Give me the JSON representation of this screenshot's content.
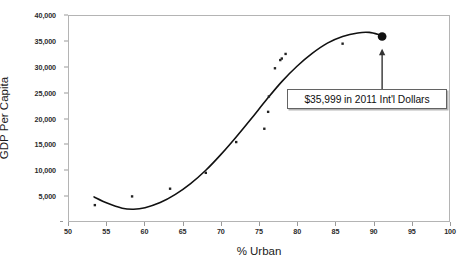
{
  "chart_data": {
    "type": "scatter",
    "title": "",
    "subtitle": "",
    "xlabel": "% Urban",
    "ylabel": "GDP Per Capita",
    "xlim": [
      50,
      100
    ],
    "ylim": [
      0,
      40000
    ],
    "grid": false,
    "legend": null,
    "x_ticks": [
      50,
      55,
      60,
      65,
      70,
      75,
      80,
      85,
      90,
      95,
      100
    ],
    "x_tick_labels": [
      "50",
      "55",
      "60",
      "65",
      "70",
      "75",
      "80",
      "85",
      "90",
      "95",
      "100"
    ],
    "y_ticks": [
      5000,
      10000,
      15000,
      20000,
      25000,
      30000,
      35000,
      40000
    ],
    "y_tick_labels": [
      "5,000",
      "10,000",
      "15,000",
      "20,000",
      "25,000",
      "30,000",
      "35,000",
      "40,000"
    ],
    "series": [
      {
        "name": "Countries",
        "type": "scatter",
        "marker": "square-dot",
        "color": "#222222",
        "points": [
          {
            "x": 53.4,
            "y": 3100
          },
          {
            "x": 58.3,
            "y": 4800
          },
          {
            "x": 63.3,
            "y": 6300
          },
          {
            "x": 68.0,
            "y": 9400
          },
          {
            "x": 72.0,
            "y": 15400
          },
          {
            "x": 75.7,
            "y": 18000
          },
          {
            "x": 76.2,
            "y": 21300
          },
          {
            "x": 76.3,
            "y": 24300
          },
          {
            "x": 77.1,
            "y": 29800
          },
          {
            "x": 77.8,
            "y": 31400
          },
          {
            "x": 78.0,
            "y": 31700
          },
          {
            "x": 78.5,
            "y": 32600
          },
          {
            "x": 86.0,
            "y": 34600
          }
        ]
      },
      {
        "name": "Fitted cubic trend",
        "type": "line",
        "color": "#111111",
        "points": [
          {
            "x": 53.3,
            "y": 4700
          },
          {
            "x": 55.0,
            "y": 3500
          },
          {
            "x": 57.0,
            "y": 2500
          },
          {
            "x": 58.5,
            "y": 2300
          },
          {
            "x": 60.0,
            "y": 2600
          },
          {
            "x": 62.0,
            "y": 3600
          },
          {
            "x": 64.0,
            "y": 5200
          },
          {
            "x": 66.0,
            "y": 7300
          },
          {
            "x": 68.0,
            "y": 9900
          },
          {
            "x": 70.0,
            "y": 13000
          },
          {
            "x": 72.0,
            "y": 16400
          },
          {
            "x": 74.0,
            "y": 20000
          },
          {
            "x": 76.0,
            "y": 23700
          },
          {
            "x": 78.0,
            "y": 27200
          },
          {
            "x": 80.0,
            "y": 30200
          },
          {
            "x": 82.0,
            "y": 32700
          },
          {
            "x": 84.0,
            "y": 34700
          },
          {
            "x": 86.0,
            "y": 36000
          },
          {
            "x": 88.0,
            "y": 36700
          },
          {
            "x": 89.5,
            "y": 36800
          },
          {
            "x": 91.0,
            "y": 36300
          }
        ]
      },
      {
        "name": "Highlighted point",
        "type": "scatter",
        "marker": "large-circle",
        "color": "#111111",
        "points": [
          {
            "x": 91.2,
            "y": 35999
          }
        ]
      }
    ],
    "annotations": [
      {
        "name": "callout",
        "text": "$35,999 in 2011 Int'l Dollars",
        "arrow": {
          "from_x": 91.2,
          "from_y": 25200,
          "to_x": 91.2,
          "to_y": 34200
        }
      }
    ]
  },
  "axes": {
    "x_title": "% Urban",
    "y_title": "GDP Per Capita"
  },
  "colors": {
    "frame": "#b4b4b4",
    "marker": "#222222",
    "line": "#111111",
    "annotation_border": "#636363",
    "text": "#1a1a1a",
    "background": "#ffffff"
  }
}
